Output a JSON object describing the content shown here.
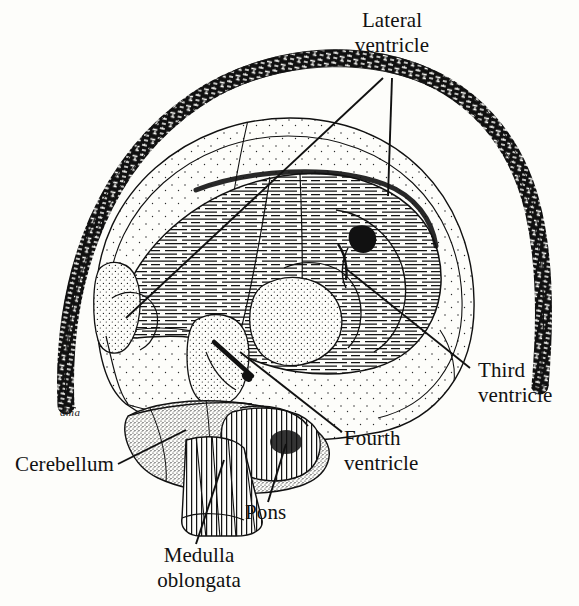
{
  "figure": {
    "view": "mid-sagittal cut-away of cerebrum, cerebellum and brainstem inside the skull/dura arc",
    "background_color": "#fdfdfa",
    "ink_color": "#111111",
    "signature": "dma"
  },
  "labels": {
    "lateral_ventricle": "Lateral\nventricle",
    "third_ventricle": "Third\nventricle",
    "fourth_ventricle": "Fourth\nventricle",
    "cerebellum": "Cerebellum",
    "pons": "Pons",
    "medulla_oblongata": "Medulla\noblongata"
  },
  "structures": [
    {
      "name": "skull-dura-band",
      "texture": "dense-dark-hatching",
      "description": "thick dark arc enclosing the brain"
    },
    {
      "name": "cerebral-cortex",
      "texture": "sparse-stipple",
      "description": "outer brain mantle, lightly dotted"
    },
    {
      "name": "lateral-ventricle-body",
      "texture": "horizontal-hatching",
      "description": "large C-shaped hatched cavity"
    },
    {
      "name": "thalamus-midbrain",
      "texture": "dense-stipple",
      "description": "central stippled mass"
    },
    {
      "name": "cerebellum",
      "texture": "very-dense-stipple",
      "description": "lower posterior lobed mass"
    },
    {
      "name": "pons",
      "texture": "vertical-striation",
      "description": "striated bulge anterior to cerebellum"
    },
    {
      "name": "medulla-oblongata",
      "texture": "vertical-lines",
      "description": "tapering stalk below the pons"
    }
  ],
  "leaders": [
    {
      "label": "lateral_ventricle",
      "target": "lateral-ventricle-anterior-horn"
    },
    {
      "label": "lateral_ventricle",
      "target": "lateral-ventricle-body"
    },
    {
      "label": "third_ventricle",
      "target": "third-ventricle-cavity"
    },
    {
      "label": "fourth_ventricle",
      "target": "fourth-ventricle-cavity"
    },
    {
      "label": "cerebellum",
      "target": "cerebellum"
    },
    {
      "label": "pons",
      "target": "pons"
    },
    {
      "label": "medulla_oblongata",
      "target": "medulla-oblongata"
    }
  ]
}
